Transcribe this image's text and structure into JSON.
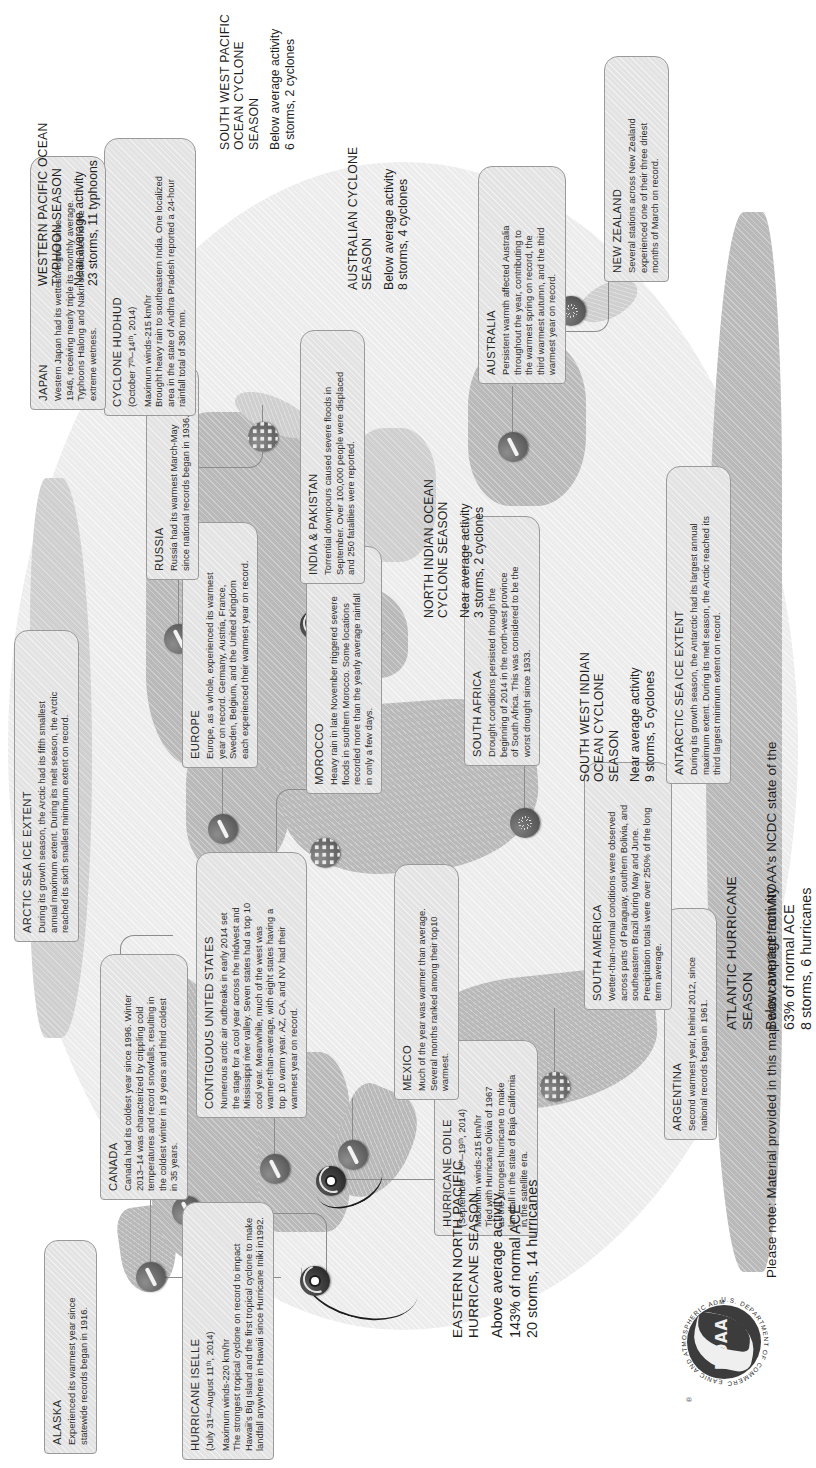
{
  "poster": {
    "footer_note": "Please note: Material provided in this map was compiled from NOAA's NCDC state of the",
    "seal": {
      "wordmark": "NOAA",
      "ring_top": "NATIONAL OCEANIC AND ATMOSPHERIC ADMINISTRATION",
      "ring_bottom": "U.S. DEPARTMENT OF COMMERCE",
      "registered_mark": "®"
    },
    "colors": {
      "ocean": "#ececec",
      "land": "#b9b9b9",
      "land_light": "#cfcfcf",
      "box_fill": "#e3e3e3",
      "box_border": "#9a9a9a",
      "text": "#2d2d2d",
      "marker_cyclone": "#1e1e1e",
      "leader": "#8c8c8c"
    }
  },
  "callouts": [
    {
      "id": "alaska",
      "title": "ALASKA",
      "body": "Experienced its warmest year since\nstatewide records began in 1916.",
      "marker": "temperature-marker"
    },
    {
      "id": "canada",
      "title": "CANADA",
      "body": "Canada had its coldest year since 1996. Winter\n2013–14 was characterized by crippling cold\ntemperatures and record snowfalls, resulting in\nthe coldest winter in 18 years and third coldest\nin 35 years.",
      "marker": "temperature-marker"
    },
    {
      "id": "hurricane-iselle",
      "title": "HURRICANE ISELLE",
      "subtitle": "(July 31ˢᵗ–August 11ᵗʰ, 2014)",
      "body": "Maximum winds-220 km/hr\nThe strongest tropical cyclone on record to impact\nHawaii's Big Island and the first tropical cyclone to make\nlandfall anywhere in Hawaii since Hurricane Iniki in1992.",
      "marker": "cyclone-marker"
    },
    {
      "id": "hurricane-odile",
      "title": "HURRICANE ODILE",
      "subtitle": "(September 10ᵗʰ–19ᵗʰ, 2014)",
      "body": "Maximum winds-215 km/hr\nTied with Hurricane Olivia of 1967\nas the strongest hurricane to make\nlandfall in the state of Baja California\nin the satellite era.",
      "marker": "cyclone-marker"
    },
    {
      "id": "contiguous-united-states",
      "title": "CONTIGUOUS UNITED STATES",
      "body": "Numerous arctic air outbreaks in early 2014 set\nthe stage for a cool year across the midwest and\nMississippi river valley. Seven states had a top 10\ncool year. Meanwhile, much of the west was\nwarmer-than-average, with eight states having a\ntop 10 warm year. AZ, CA, and NV had their\nwarmest year on record.",
      "marker": "temperature-marker"
    },
    {
      "id": "mexico",
      "title": "MEXICO",
      "body": "Much of the year was warmer than average.\nSeveral months ranked among their top10\nwarmest.",
      "marker": "temperature-marker"
    },
    {
      "id": "argentina",
      "title": "ARGENTINA",
      "body": "Second warmest year, behind 2012, since\nnational records began in 1961.",
      "marker": "temperature-marker"
    },
    {
      "id": "south-america",
      "title": "SOUTH AMERICA",
      "body": "Wetter-than-normal conditions were observed\nacross parts of Paraguay, southern Bolivia, and\nsoutheastern Brazil during May and June.\nPrecipitation totals were over 250% of the long\nterm average.",
      "marker": "rain-marker"
    },
    {
      "id": "morocco",
      "title": "MOROCCO",
      "body": "Heavy rain in late November triggered severe\nfloods in southern Morocco. Some locations\nrecorded more than the yearly average rainfall\nin only a few days.",
      "marker": "rain-marker"
    },
    {
      "id": "south-africa",
      "title": "SOUTH AFRICA",
      "body": "Drought conditions persisted through the\nbeginning of 2014 in the north-west province\nof South Africa. This was considered to be the\nworst drought since 1933.",
      "marker": "drought-marker"
    },
    {
      "id": "europe",
      "title": "EUROPE",
      "body": "Europe, as a whole, experienced its warmest\nyear on record. Germany, Austria, France,\nSweden, Belgium, and the United Kingdom\neach experienced their warmest year on record.",
      "marker": "temperature-marker"
    },
    {
      "id": "russia",
      "title": "RUSSIA",
      "body": "Russia had its warmest March-May\nsince national records began in 1936.",
      "marker": "temperature-marker"
    },
    {
      "id": "india-pakistan",
      "title": "INDIA & PAKISTAN",
      "body": "Torrential downpours caused severe floods in\nSeptember. Over 100,000 people were displaced\nand 250 fatalities were reported.",
      "marker": "rain-marker"
    },
    {
      "id": "cyclone-hudhud",
      "title": "CYCLONE HUDHUD",
      "subtitle": "(October 7ᵗʰ–14ᵗʰ, 2014)",
      "body": "Maximum winds-215 km/hr\nBrought heavy rain to southeastern India. One localized\narea in the state of Andhra Pradesh reported a 24-hour\nrainfall total of 380 mm.",
      "marker": "cyclone-marker"
    },
    {
      "id": "japan",
      "title": "JAPAN",
      "body": "Western Japan had its wettest August since\n1946, receiving nearly triple its monthly average.\nTyphoons Halong and Nakri contributed to the\nextreme wetness.",
      "marker": "rain-marker"
    },
    {
      "id": "australia",
      "title": "AUSTRALIA",
      "body": "Persistent warmth affected Australia\nthroughout the year, contributing to\nthe warmest spring on record, the\nthird warmest autumn, and the third\nwarmest year on record.",
      "marker": "temperature-marker"
    },
    {
      "id": "new-zealand",
      "title": "NEW ZEALAND",
      "body": "Several stations across New Zealand\nexperienced one of their three driest\nmonths of March on record.",
      "marker": "drought-marker"
    },
    {
      "id": "arctic-sea-ice-extent",
      "title": "ARCTIC SEA ICE EXTENT",
      "body": "During its growth season, the Arctic had its fifth smallest\nannual maximum extent. During its melt season, the Arctic\nreached its sixth smallest minimum extent on record.",
      "marker": "sea-ice-marker"
    },
    {
      "id": "antarctic-sea-ice-extent",
      "title": "ANTARCTIC SEA ICE EXTENT",
      "body": "During its growth season, the Antarctic had its largest annual\nmaximum extent. During its melt season, the Arctic reached its\nthird largest minimum extent on record.",
      "marker": "sea-ice-marker"
    }
  ],
  "seasons": [
    {
      "id": "eastern-north-pacific-hurricane-season",
      "title": "EASTERN NORTH PACIFIC\nHURRICANE SEASON",
      "value": "Above average activity\n143% of normal ACE\n20 storms, 14 hurricanes",
      "emphasis": true
    },
    {
      "id": "atlantic-hurricane-season",
      "title": "ATLANTIC HURRICANE\nSEASON",
      "value": "Below average activity\n63% of normal ACE\n8 storms, 6 hurricanes",
      "emphasis": true
    },
    {
      "id": "south-west-indian-ocean-cyclone-season",
      "title": "SOUTH WEST INDIAN\nOCEAN CYCLONE\nSEASON",
      "value": "Near average activity\n9 storms, 5 cyclones",
      "emphasis": false
    },
    {
      "id": "north-indian-ocean-cyclone-season",
      "title": "NORTH INDIAN OCEAN\nCYCLONE SEASON",
      "value": "Near average activity\n3 storms, 2 cyclones",
      "emphasis": false
    },
    {
      "id": "western-pacific-ocean-typhoon-season",
      "title": "WESTERN PACIFIC OCEAN\nTYPHOON SEASON",
      "value": "Near average activity\n23 storms, 11 typhoons",
      "emphasis": false
    },
    {
      "id": "australian-cyclone-season",
      "title": "AUSTRALIAN CYCLONE\nSEASON",
      "value": "Below average activity\n8 storms, 4 cyclones",
      "emphasis": false
    },
    {
      "id": "south-west-pacific-ocean-cyclone-season",
      "title": "SOUTH WEST PACIFIC\nOCEAN CYCLONE\nSEASON",
      "value": "Below average activity\n6 storms, 2 cyclones",
      "emphasis": false
    }
  ]
}
